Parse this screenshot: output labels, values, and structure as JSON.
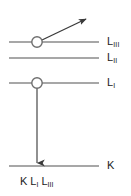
{
  "diagram": {
    "type": "atomic-energy-level-transition-diagram",
    "background_color": "#ffffff",
    "line_color": "#808080",
    "arrow_color": "#404040",
    "text_color": "#1a1a1a",
    "levels": [
      {
        "id": "l3",
        "label_base": "L",
        "label_sub": "III",
        "y": 42,
        "x_start": 9,
        "x_end": 99,
        "has_hole": true,
        "hole_x": 37
      },
      {
        "id": "l2",
        "label_base": "L",
        "label_sub": "II",
        "y": 58,
        "x_start": 9,
        "x_end": 99,
        "has_hole": false,
        "hole_x": null
      },
      {
        "id": "l1",
        "label_base": "L",
        "label_sub": "I",
        "y": 83,
        "x_start": 9,
        "x_end": 99,
        "has_hole": true,
        "hole_x": 37
      },
      {
        "id": "k",
        "label_base": "K",
        "label_sub": "",
        "y": 166,
        "x_start": 9,
        "x_end": 99,
        "has_hole": false,
        "hole_x": null
      }
    ],
    "arrows": [
      {
        "id": "auger-electron-emission",
        "kind": "diagonal-outgoing",
        "x1": 41,
        "y1": 40,
        "x2": 88,
        "y2": 17
      },
      {
        "id": "electron-transition-l1-to-k",
        "kind": "vertical-down",
        "x1": 37,
        "y1": 88,
        "x2": 37,
        "y2": 166
      }
    ],
    "caption": {
      "parts": [
        {
          "base": "K",
          "sub": ""
        },
        {
          "base": "L",
          "sub": "I"
        },
        {
          "base": "L",
          "sub": "III"
        }
      ],
      "x": 20,
      "y": 180
    }
  }
}
